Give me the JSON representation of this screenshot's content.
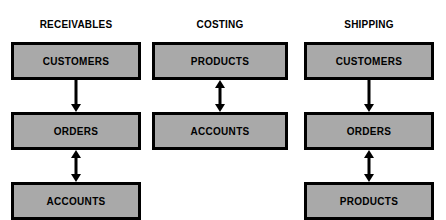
{
  "diagram": {
    "type": "system-entity-diagram",
    "background_color": "#ffffff",
    "box_fill_color": "#a9a9a9",
    "box_border_color": "#000000",
    "text_color": "#000000",
    "columns": [
      {
        "id": "receivables",
        "title_line1": "RECEIVABLES",
        "title_line2": "SYSTEM",
        "nodes": [
          {
            "label": "CUSTOMERS"
          },
          {
            "label": "ORDERS"
          },
          {
            "label": "ACCOUNTS"
          }
        ],
        "connectors": [
          {
            "from": "CUSTOMERS",
            "to": "ORDERS",
            "direction": "down"
          },
          {
            "from": "ORDERS",
            "to": "ACCOUNTS",
            "direction": "both"
          }
        ]
      },
      {
        "id": "costing",
        "title_line1": "COSTING",
        "title_line2": "SYSTEM",
        "nodes": [
          {
            "label": "PRODUCTS"
          },
          {
            "label": "ACCOUNTS"
          }
        ],
        "connectors": [
          {
            "from": "PRODUCTS",
            "to": "ACCOUNTS",
            "direction": "both"
          }
        ]
      },
      {
        "id": "shipping",
        "title_line1": "SHIPPING",
        "title_line2": "SYSTEM",
        "nodes": [
          {
            "label": "CUSTOMERS"
          },
          {
            "label": "ORDERS"
          },
          {
            "label": "PRODUCTS"
          }
        ],
        "connectors": [
          {
            "from": "CUSTOMERS",
            "to": "ORDERS",
            "direction": "down"
          },
          {
            "from": "ORDERS",
            "to": "PRODUCTS",
            "direction": "both"
          }
        ]
      }
    ]
  }
}
